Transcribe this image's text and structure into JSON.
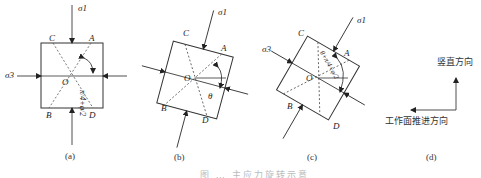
{
  "figure": {
    "caption": "图 … 主应力旋转示意",
    "panels": [
      {
        "id": "a",
        "label": "(a)",
        "rotation_deg": 0,
        "corners": {
          "top_left": "C",
          "top_right": "A",
          "bottom_left": "B",
          "bottom_right": "D"
        },
        "center": "O",
        "stress_labels": {
          "vertical": "σ1",
          "horizontal": "σ3"
        },
        "angle_label": "π/4+φ/2"
      },
      {
        "id": "b",
        "label": "(b)",
        "rotation_deg": 15,
        "corners": {
          "top_left": "C",
          "top_right": "A",
          "bottom_left": "B",
          "bottom_right": "D"
        },
        "center": "O",
        "stress_labels": {
          "vertical": "σ1",
          "horizontal": "σ3"
        },
        "angle_label": "θ"
      },
      {
        "id": "c",
        "label": "(c)",
        "rotation_deg": 30,
        "corners": {
          "top_left": "C",
          "top_right": "A",
          "bottom_left": "B",
          "bottom_right": "D"
        },
        "center": "O",
        "stress_labels": {
          "vertical": "σ1",
          "horizontal": "σ3"
        },
        "angle_label": "θ+π/4+φ/2"
      },
      {
        "id": "d",
        "label": "(d)",
        "vertical_direction": "竖直方向",
        "advance_direction": "工作面推进方向"
      }
    ]
  },
  "colors": {
    "line": "#333333",
    "dashed": "#555555",
    "text": "#222222"
  }
}
